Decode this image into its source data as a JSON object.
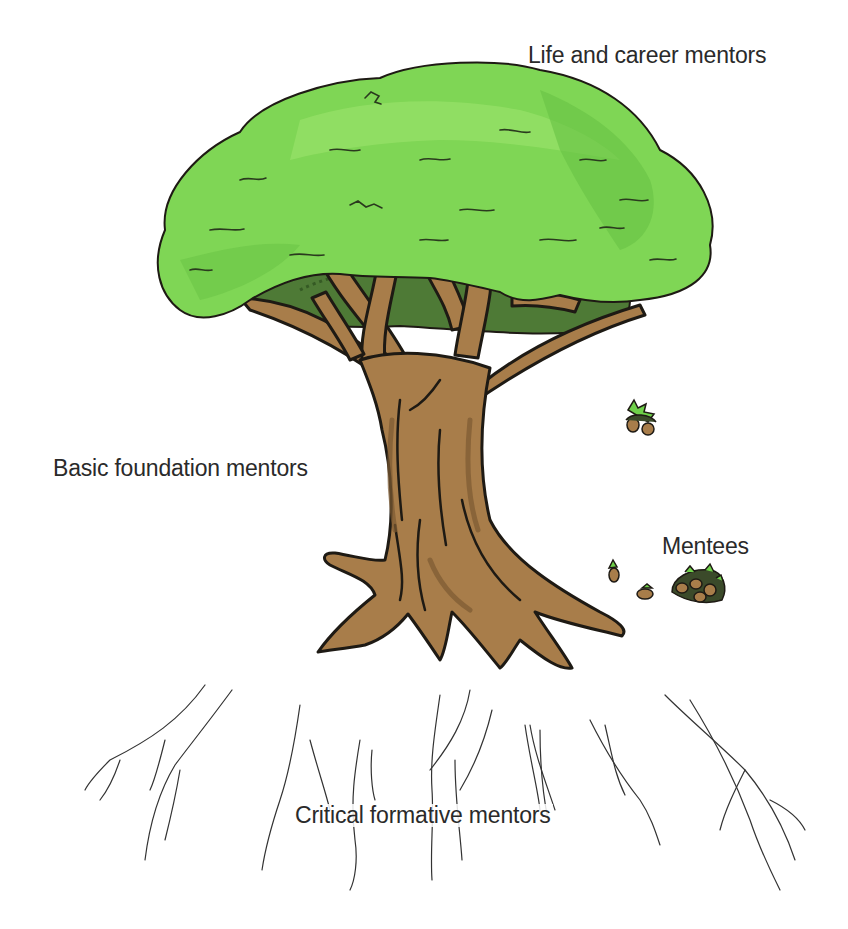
{
  "diagram": {
    "labels": {
      "canopy": "Life and career mentors",
      "trunk": "Basic foundation mentors",
      "acorns": "Mentees",
      "roots": "Critical formative mentors"
    },
    "colors": {
      "canopy_light": "#8ddc5e",
      "canopy_mid": "#72c94a",
      "canopy_shadow": "#4e7a36",
      "trunk": "#a87d4a",
      "trunk_shadow": "#7d5a32",
      "outline": "#1e1a14",
      "roots": "#333333",
      "text": "#2a2a2a",
      "background": "#ffffff"
    }
  }
}
